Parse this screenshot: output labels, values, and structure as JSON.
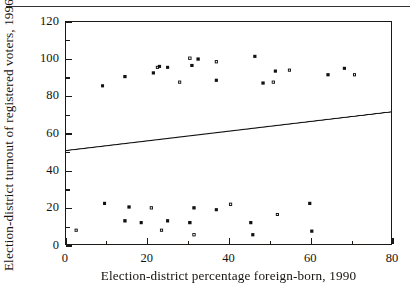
{
  "figure": {
    "kind": "scatterplot",
    "has_top_rule": true
  },
  "chart_data": {
    "type": "scatter",
    "title": "",
    "xlabel": "Election-district percentage foreign-born, 1990",
    "ylabel": "Election-district turnout of registered voters, 1996",
    "xlim": [
      0,
      80
    ],
    "ylim": [
      0,
      120
    ],
    "xticks": [
      0,
      20,
      40,
      60,
      80
    ],
    "xticklabels": [
      "0",
      "20",
      "40",
      "60",
      "80"
    ],
    "xminorticks": [
      10,
      30,
      50,
      70
    ],
    "yticks": [
      0,
      20,
      40,
      60,
      80,
      100,
      120
    ],
    "yticklabels": [
      "0",
      "20",
      "40",
      "60",
      "80",
      "100",
      "120"
    ],
    "yminorticks": [
      10,
      30,
      50,
      70,
      90,
      110
    ],
    "grid": false,
    "legend": null,
    "marker": {
      "shape": "square",
      "size_px": 3.2,
      "color": "#111111",
      "style": "mixed open and filled"
    },
    "n_points": 1520,
    "point_cloud": {
      "description": "Dense positively-sloped cloud of election districts; core mass spans turnout 42-72 with thinning tails down to ~5 and up to ~102; x density peaks between 5 and 40 percent foreign-born and thins beyond 72.",
      "x_range_observed": [
        1.5,
        76.0
      ],
      "y_range_observed": [
        4.5,
        102.0
      ],
      "core_y_range": [
        42,
        72
      ],
      "x_density_profile": [
        {
          "x": 2,
          "weight": 0.55
        },
        {
          "x": 6,
          "weight": 1.0
        },
        {
          "x": 12,
          "weight": 0.97
        },
        {
          "x": 18,
          "weight": 0.92
        },
        {
          "x": 24,
          "weight": 0.86
        },
        {
          "x": 30,
          "weight": 0.8
        },
        {
          "x": 36,
          "weight": 0.72
        },
        {
          "x": 42,
          "weight": 0.62
        },
        {
          "x": 48,
          "weight": 0.54
        },
        {
          "x": 54,
          "weight": 0.5
        },
        {
          "x": 60,
          "weight": 0.46
        },
        {
          "x": 66,
          "weight": 0.3
        },
        {
          "x": 70,
          "weight": 0.18
        },
        {
          "x": 74,
          "weight": 0.07
        },
        {
          "x": 77,
          "weight": 0.02
        }
      ],
      "trend_mean_y_at_x": [
        {
          "x": 0,
          "y": 50.5
        },
        {
          "x": 20,
          "y": 55.8
        },
        {
          "x": 40,
          "y": 61.0
        },
        {
          "x": 60,
          "y": 66.2
        },
        {
          "x": 80,
          "y": 71.4
        }
      ],
      "spread_sd_at_x": [
        {
          "x": 0,
          "sd": 9.0
        },
        {
          "x": 20,
          "sd": 10.5
        },
        {
          "x": 40,
          "sd": 11.5
        },
        {
          "x": 60,
          "sd": 12.0
        },
        {
          "x": 80,
          "sd": 11.0
        }
      ],
      "low_outliers": [
        {
          "x": 2.5,
          "y": 7.5
        },
        {
          "x": 14.5,
          "y": 12.5
        },
        {
          "x": 18.5,
          "y": 11.5
        },
        {
          "x": 23.5,
          "y": 7.5
        },
        {
          "x": 25.0,
          "y": 12.5
        },
        {
          "x": 30.5,
          "y": 11.5
        },
        {
          "x": 31.5,
          "y": 5.0
        },
        {
          "x": 45.5,
          "y": 11.5
        },
        {
          "x": 46.0,
          "y": 5.0
        },
        {
          "x": 52.0,
          "y": 16.0
        },
        {
          "x": 60.5,
          "y": 7.0
        },
        {
          "x": 15.5,
          "y": 20.0
        },
        {
          "x": 21.0,
          "y": 19.5
        },
        {
          "x": 31.5,
          "y": 19.5
        },
        {
          "x": 37.0,
          "y": 18.5
        },
        {
          "x": 40.5,
          "y": 21.5
        },
        {
          "x": 60.0,
          "y": 22.0
        },
        {
          "x": 9.5,
          "y": 22.0
        }
      ],
      "high_outliers": [
        {
          "x": 22.5,
          "y": 95.5
        },
        {
          "x": 23.0,
          "y": 96.0
        },
        {
          "x": 25.0,
          "y": 95.5
        },
        {
          "x": 30.5,
          "y": 100.5
        },
        {
          "x": 31.0,
          "y": 96.5
        },
        {
          "x": 32.5,
          "y": 100.0
        },
        {
          "x": 37.0,
          "y": 98.5
        },
        {
          "x": 46.5,
          "y": 101.5
        },
        {
          "x": 51.5,
          "y": 93.5
        },
        {
          "x": 55.0,
          "y": 94.0
        },
        {
          "x": 64.5,
          "y": 91.5
        },
        {
          "x": 68.5,
          "y": 95.0
        },
        {
          "x": 71.0,
          "y": 91.5
        },
        {
          "x": 21.5,
          "y": 92.5
        },
        {
          "x": 14.5,
          "y": 90.5
        },
        {
          "x": 28.0,
          "y": 87.5
        },
        {
          "x": 37.0,
          "y": 88.5
        },
        {
          "x": 48.5,
          "y": 87.0
        },
        {
          "x": 51.0,
          "y": 87.5
        },
        {
          "x": 9.0,
          "y": 85.5
        }
      ],
      "seed": 20250417
    },
    "fit_line": {
      "label": "",
      "visible": true,
      "x0": 0,
      "y0": 50.5,
      "x1": 80,
      "y1": 71.4,
      "color": "#111111",
      "width_px": 1.1
    }
  },
  "colors": {
    "ink": "#15120f",
    "frame": "#1b1815",
    "marker": "#111111",
    "paper": "#ffffff"
  }
}
